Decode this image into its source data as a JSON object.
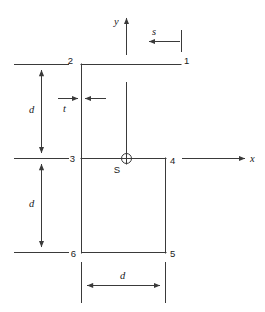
{
  "figure": {
    "background_color": "#ffffff",
    "line_color": "#3a3a3a",
    "text_color": "#1a1a1a"
  },
  "axes": {
    "x_label": "x",
    "y_label": "y",
    "origin_label": "S"
  },
  "corners": [
    {
      "id": "1",
      "label": "1"
    },
    {
      "id": "2",
      "label": "2"
    },
    {
      "id": "3",
      "label": "3"
    },
    {
      "id": "4",
      "label": "4"
    },
    {
      "id": "5",
      "label": "5"
    },
    {
      "id": "6",
      "label": "6"
    }
  ],
  "dimensions": [
    {
      "id": "d-upper",
      "label": "d",
      "orientation": "vertical"
    },
    {
      "id": "d-lower",
      "label": "d",
      "orientation": "vertical"
    },
    {
      "id": "d-bottom",
      "label": "d",
      "orientation": "horizontal"
    },
    {
      "id": "t-thickness",
      "label": "t",
      "orientation": "horizontal"
    },
    {
      "id": "s-coordinate",
      "label": "s",
      "orientation": "horizontal"
    }
  ]
}
